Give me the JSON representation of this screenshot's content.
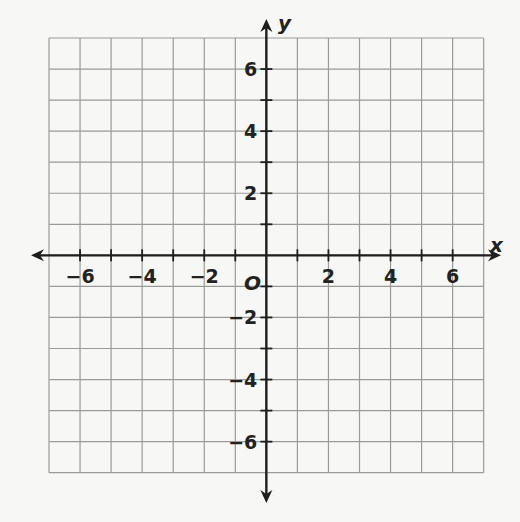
{
  "chart_data": {
    "type": "scatter",
    "title": "",
    "xlabel": "x",
    "ylabel": "y",
    "origin_label": "O",
    "xlim": [
      -7,
      7
    ],
    "ylim": [
      -7,
      7
    ],
    "grid": true,
    "grid_step": 1,
    "x_tick_labels": [
      "−6",
      "−4",
      "−2",
      "2",
      "4",
      "6"
    ],
    "x_tick_values": [
      -6,
      -4,
      -2,
      2,
      4,
      6
    ],
    "y_tick_labels": [
      "6",
      "4",
      "2",
      "−2",
      "−4",
      "−6"
    ],
    "y_tick_values": [
      6,
      4,
      2,
      -2,
      -4,
      -6
    ],
    "series": [],
    "legend": null,
    "colors": {
      "grid": "#9a9a9a",
      "axis": "#1e1e1e",
      "background": "#f7f7f5"
    }
  }
}
